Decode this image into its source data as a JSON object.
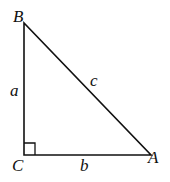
{
  "diagram": {
    "type": "right-triangle",
    "vertices": {
      "B": {
        "label": "B",
        "x": 24,
        "y": 23
      },
      "C": {
        "label": "C",
        "x": 24,
        "y": 155
      },
      "A": {
        "label": "A",
        "x": 151,
        "y": 155
      }
    },
    "sides": {
      "a": {
        "label": "a",
        "between": [
          "B",
          "C"
        ]
      },
      "b": {
        "label": "b",
        "between": [
          "C",
          "A"
        ]
      },
      "c": {
        "label": "c",
        "between": [
          "B",
          "A"
        ]
      }
    },
    "right_angle_at": "C",
    "stroke_color": "#111111",
    "background": "#ffffff"
  }
}
